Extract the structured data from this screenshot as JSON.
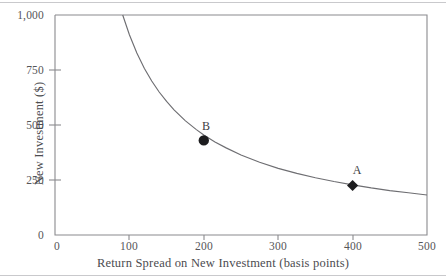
{
  "chart_data": {
    "type": "line",
    "title": "",
    "subtitle": "",
    "xlabel": "Return Spread on New Investment (basis points)",
    "ylabel": "New Investment ($)",
    "xlim": [
      0,
      500
    ],
    "ylim": [
      0,
      1000
    ],
    "xticks": [
      "0",
      "100",
      "200",
      "300",
      "400",
      "500"
    ],
    "xtick_values": [
      0,
      100,
      200,
      300,
      400,
      500
    ],
    "yticks": [
      "0",
      "250",
      "500",
      "750",
      "1,000"
    ],
    "ytick_values": [
      0,
      250,
      500,
      750,
      1000
    ],
    "grid": false,
    "legend": "none",
    "series": [
      {
        "name": "new investment curve",
        "kind": "line",
        "description": "downward sloping convex hyperbola, y = 91000 / x",
        "x": [
          91,
          100,
          110,
          120,
          130,
          140,
          150,
          160,
          175,
          190,
          200,
          215,
          230,
          250,
          275,
          300,
          325,
          350,
          375,
          400,
          425,
          450,
          475,
          500
        ],
        "y": [
          1000,
          910,
          827,
          758,
          700,
          650,
          607,
          569,
          520,
          479,
          455,
          423,
          396,
          364,
          331,
          303,
          280,
          260,
          243,
          228,
          214,
          202,
          192,
          182
        ]
      }
    ],
    "annotations": [
      {
        "label": "B",
        "marker": "circle",
        "x": 200,
        "y": 430,
        "label_position": "above"
      },
      {
        "label": "A",
        "marker": "diamond",
        "x": 400,
        "y": 225,
        "label_position": "above"
      }
    ],
    "colors": {
      "curve": "#6e6e72",
      "frame": "#8a8a8e",
      "marker": "#1d1d1f",
      "text": "#4c4c50",
      "background": "#ffffff",
      "rule": "#c9c9cc"
    }
  },
  "axes": {
    "y_title": "New Investment ($)",
    "x_title": "Return Spread on New Investment (basis points)",
    "y_tick_labels": [
      "1,000",
      "750",
      "500",
      "250",
      "0"
    ],
    "x_tick_labels": [
      "0",
      "100",
      "200",
      "300",
      "400",
      "500"
    ]
  },
  "points": {
    "a_label": "A",
    "b_label": "B"
  }
}
